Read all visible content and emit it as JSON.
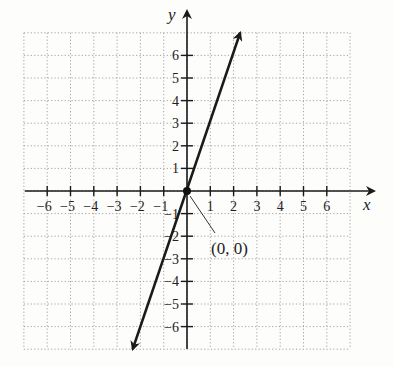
{
  "chart_data": {
    "type": "line",
    "title": "",
    "xlabel": "x",
    "ylabel": "y",
    "xlim": [
      -7,
      7
    ],
    "ylim": [
      -7,
      7
    ],
    "grid": true,
    "x_ticks": [
      -6,
      -5,
      -4,
      -3,
      -2,
      -1,
      1,
      2,
      3,
      4,
      5,
      6
    ],
    "y_ticks": [
      -6,
      -5,
      -4,
      -3,
      -2,
      -1,
      1,
      2,
      3,
      4,
      5,
      6
    ],
    "x_tick_labels": [
      "−6",
      "−5",
      "−4",
      "−3",
      "−2",
      "−1",
      "1",
      "2",
      "3",
      "4",
      "5",
      "6"
    ],
    "y_tick_labels": [
      "−6",
      "−5",
      "−4",
      "−3",
      "−2",
      "−1",
      "1",
      "2",
      "3",
      "4",
      "5",
      "6"
    ],
    "series": [
      {
        "name": "y = 3x",
        "equation": "y = 3x",
        "x": [
          -2.33,
          2.28
        ],
        "y": [
          -7,
          7
        ],
        "arrows": "both"
      }
    ],
    "points": [
      {
        "x": 0,
        "y": 0,
        "label": "(0, 0)"
      }
    ],
    "annotations": [
      {
        "text": "(0, 0)",
        "x": 0,
        "y": 0
      }
    ]
  },
  "labels": {
    "x_axis": "x",
    "y_axis": "y",
    "origin_point": "(0, 0)"
  },
  "colors": {
    "axis": "#1a1a1a",
    "line": "#1a1a1a",
    "grid": "#9a9a9a",
    "background": "#fdfdfc"
  }
}
